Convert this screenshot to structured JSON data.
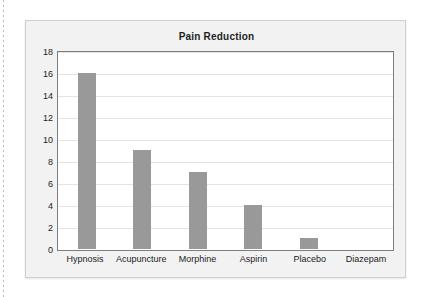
{
  "chart_data": {
    "type": "bar",
    "title": "Pain Reduction",
    "xlabel": "",
    "ylabel": "",
    "categories": [
      "Hypnosis",
      "Acupuncture",
      "Morphine",
      "Aspirin",
      "Placebo",
      "Diazepam"
    ],
    "values": [
      16,
      9,
      7,
      4,
      1,
      0
    ],
    "ylim": [
      0,
      18
    ],
    "yticks": [
      0,
      2,
      4,
      6,
      8,
      10,
      12,
      14,
      16,
      18
    ],
    "ytick_labels": [
      "0",
      "2",
      "4",
      "6",
      "8",
      "10",
      "12",
      "14",
      "16",
      "18"
    ],
    "grid": true,
    "grid_axis": "y",
    "legend": false,
    "bar_color": "#999999",
    "plot_background": "#ffffff",
    "panel_background": "#f2f2f2",
    "frame_color": "#7d7d7d",
    "gridline_color": "#e3e3e3",
    "text_color": "#222222"
  }
}
